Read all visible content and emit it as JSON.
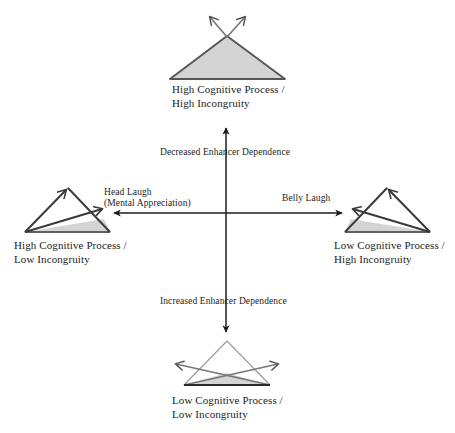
{
  "figure": {
    "background_color": "#ffffff",
    "stroke_color": "#4a4a4a",
    "dark_stroke_color": "#2b2b2b",
    "fill_color": "#d4d4d4",
    "axis_color": "#1c1c1c"
  },
  "quadrants": {
    "top": {
      "id": "high-cognitive-high-incongruity",
      "line1": "High Cognitive Process /",
      "line2": "High Incongruity",
      "icon": "triangle-filled-two-up-arrows"
    },
    "left": {
      "id": "high-cognitive-low-incongruity",
      "line1": "High Cognitive Process /",
      "line2": "Low Incongruity",
      "icon": "triangle-outline-sliver-fill-two-arrows"
    },
    "right": {
      "id": "low-cognitive-high-incongruity",
      "line1": "Low Cognitive Process /",
      "line2": "High Incongruity",
      "icon": "triangle-outline-sliver-fill-two-arrows-mirrored"
    },
    "bottom": {
      "id": "low-cognitive-low-incongruity",
      "line1": "Low Cognitive Process /",
      "line2": "Low Incongruity",
      "icon": "triangle-outline-crossed-outward-arrows"
    }
  },
  "axes": {
    "vertical_up_label": "Decreased Enhancer Dependence",
    "vertical_down_label": "Increased Enhancer Dependence",
    "horizontal_left_label_line1": "Head Laugh",
    "horizontal_left_label_line2": "(Mental Appreciation)",
    "horizontal_right_label": "Belly Laugh",
    "center_x": 226,
    "center_y": 213
  }
}
